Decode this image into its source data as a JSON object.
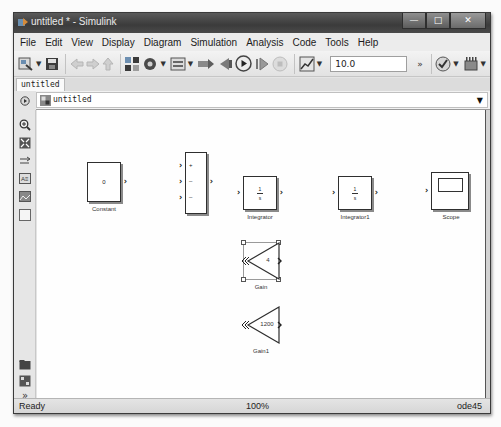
{
  "window": {
    "title": "untitled * - Simulink",
    "controls": {
      "minimize": "—",
      "maximize": "□",
      "close": "✕"
    }
  },
  "menubar": {
    "items": [
      "File",
      "Edit",
      "View",
      "Display",
      "Diagram",
      "Simulation",
      "Analysis",
      "Code",
      "Tools",
      "Help"
    ]
  },
  "toolbar": {
    "icons": [
      "new-model-icon",
      "save-icon",
      "back-icon",
      "forward-icon",
      "up-icon",
      "library-browser-icon",
      "model-config-icon",
      "model-explorer-icon",
      "build-icon",
      "step-back-icon",
      "run-icon",
      "step-forward-icon",
      "stop-icon",
      "data-inspector-icon",
      "model-advisor-icon",
      "more-icon"
    ],
    "stop_time": "10.0",
    "overflow": "»"
  },
  "tabs": [
    {
      "label": "untitled",
      "active": true
    }
  ],
  "address": {
    "path": "untitled",
    "caret": "▼"
  },
  "palette": {
    "icons": [
      "zoom-icon",
      "fit-view-icon",
      "arrow-route-icon",
      "annotation-icon",
      "image-icon",
      "area-icon",
      "browser-icon",
      "explorer-bar-icon",
      "expand-icon"
    ],
    "expand_label": "»"
  },
  "blocks": {
    "constant": {
      "name": "Constant",
      "value": "0"
    },
    "sum": {
      "name": "Sum",
      "signs": [
        "+",
        "–",
        "–"
      ]
    },
    "integrator": {
      "name": "Integrator",
      "num": "1",
      "den": "s"
    },
    "integrator1": {
      "name": "Integrator1",
      "num": "1",
      "den": "s"
    },
    "scope": {
      "name": "Scope"
    },
    "gain": {
      "name": "Gain",
      "value": "4",
      "selected": true
    },
    "gain1": {
      "name": "Gain1",
      "value": "1200"
    }
  },
  "status": {
    "state": "Ready",
    "zoom": "100%",
    "solver": "ode45"
  }
}
